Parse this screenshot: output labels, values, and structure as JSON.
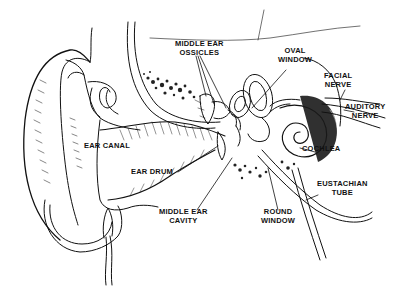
{
  "colors": {
    "background": "#ffffff",
    "ink": "#111111"
  },
  "labels": {
    "middle_ear_ossicles": {
      "line1": "MIDDLE EAR",
      "line2": "OSSICLES"
    },
    "oval_window": {
      "line1": "OVAL",
      "line2": "WINDOW"
    },
    "facial_nerve": {
      "line1": "FACIAL",
      "line2": "NERVE"
    },
    "auditory_nerve": {
      "line1": "AUDITORY",
      "line2": "NERVE"
    },
    "ear_canal": {
      "line1": "EAR CANAL"
    },
    "cochlea": {
      "line1": "COCHLEA"
    },
    "ear_drum": {
      "line1": "EAR DRUM"
    },
    "eustachian_tube": {
      "line1": "EUSTACHIAN",
      "line2": "TUBE"
    },
    "middle_ear_cavity": {
      "line1": "MIDDLE EAR",
      "line2": "CAVITY"
    },
    "round_window": {
      "line1": "ROUND",
      "line2": "WINDOW"
    }
  }
}
